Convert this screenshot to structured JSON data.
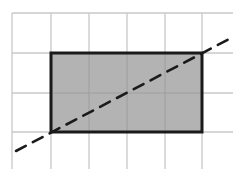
{
  "diagram": {
    "type": "grid-with-shaded-rectangle-and-diagonal-line",
    "grid": {
      "columns_x": [
        12,
        51,
        89,
        127,
        165,
        202,
        240
      ],
      "rows_y": [
        13,
        53,
        93,
        132,
        172
      ],
      "cell_size": 39,
      "line_color": "#c8c8c8"
    },
    "rectangle": {
      "x1": 51,
      "y1": 53,
      "x2": 202,
      "y2": 132,
      "width_units": 4,
      "height_units": 2,
      "fill": "#b3b3b3",
      "stroke": "#1a1a1a"
    },
    "diagonal": {
      "x1": 16,
      "y1": 151,
      "x2": 233,
      "y2": 37,
      "style": "dashed",
      "passes_through": [
        "rectangle-bottom-left-corner",
        "rectangle-top-right-corner"
      ],
      "stroke": "#1a1a1a"
    }
  }
}
